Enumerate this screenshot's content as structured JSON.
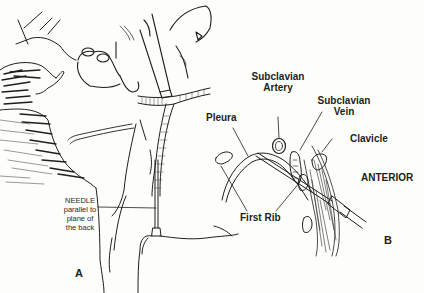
{
  "figure": {
    "panel_a": {
      "letter": "A",
      "needle_label": {
        "line1": "NEEDLE",
        "line2": "parallel to",
        "line3": "plane of",
        "line4": "the back"
      }
    },
    "panel_b": {
      "letter": "B",
      "labels": {
        "subclavian_artery_1": "Subclavian",
        "subclavian_artery_2": "Artery",
        "subclavian_vein_1": "Subclavian",
        "subclavian_vein_2": "Vein",
        "pleura": "Pleura",
        "clavicle": "Clavicle",
        "first_rib": "First Rib",
        "anterior": "ANTERIOR"
      }
    },
    "colors": {
      "ink": "#1e1e1e",
      "paper": "#fdfdfb"
    }
  }
}
